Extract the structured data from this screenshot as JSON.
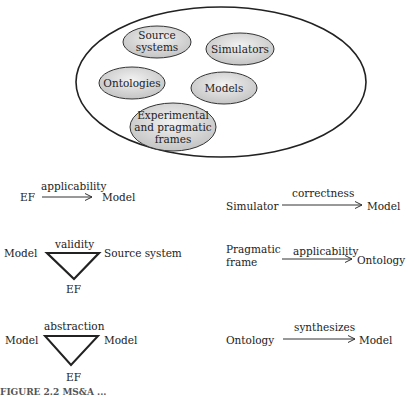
{
  "container": {
    "items": [
      {
        "label": "Source systems",
        "lines": [
          "Source",
          "systems"
        ]
      },
      {
        "label": "Simulators",
        "lines": [
          "Simulators"
        ]
      },
      {
        "label": "Ontologies",
        "lines": [
          "Ontologies"
        ]
      },
      {
        "label": "Models",
        "lines": [
          "Models"
        ]
      },
      {
        "label": "Experimental and pragmatic frames",
        "lines": [
          "Experimental",
          "and pragmatic",
          "frames"
        ]
      }
    ]
  },
  "relations": {
    "ef_applicability": {
      "from": "EF",
      "label": "applicability",
      "to": "Model"
    },
    "validity": {
      "left": "Model",
      "label": "validity",
      "right": "Source system",
      "bottom": "EF"
    },
    "abstraction": {
      "left": "Model",
      "label": "abstraction",
      "right": "Model",
      "bottom": "EF"
    },
    "correctness": {
      "from": "Simulator",
      "label": "correctness",
      "to": "Model"
    },
    "pf_applicability": {
      "from_line1": "Pragmatic",
      "from_line2": "frame",
      "label": "applicability",
      "to": "Ontology"
    },
    "synthesizes": {
      "from": "Ontology",
      "label": "synthesizes",
      "to": "Model"
    }
  },
  "caption": "FIGURE 2.2  MS&A ..."
}
